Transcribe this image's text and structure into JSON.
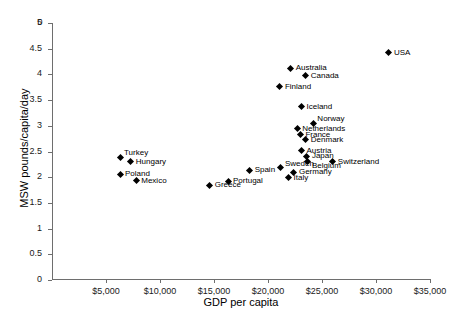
{
  "chart_data": {
    "type": "scatter",
    "title": "",
    "xlabel": "GDP per capita",
    "ylabel": "MSW  pounds/capita/day",
    "xlim": [
      0,
      35000
    ],
    "ylim": [
      0,
      5
    ],
    "grid": false,
    "legend": null,
    "xticks": [
      0,
      5000,
      10000,
      15000,
      20000,
      25000,
      30000,
      35000
    ],
    "xticklabels": [
      "0",
      "$5,000",
      "$10,000",
      "$15,000",
      "$20,000",
      "$25,000",
      "$30,000",
      "$35,000"
    ],
    "yticks": [
      0,
      0.5,
      1,
      1.5,
      2,
      2.5,
      3,
      3.5,
      4,
      4.5,
      5
    ],
    "yticklabels": [
      "0",
      "0.5",
      "1",
      "1.5",
      "2",
      "2.5",
      "3",
      "3.5",
      "4",
      "4.5",
      "5"
    ],
    "marker": "diamond",
    "marker_color": "#000000",
    "points": [
      {
        "label": "USA",
        "x": 31200,
        "y": 4.42,
        "label_pos": "right"
      },
      {
        "label": "Australia",
        "x": 22100,
        "y": 4.12,
        "label_pos": "right"
      },
      {
        "label": "Canada",
        "x": 23500,
        "y": 3.97,
        "label_pos": "right"
      },
      {
        "label": "Finland",
        "x": 21100,
        "y": 3.76,
        "label_pos": "right"
      },
      {
        "label": "Iceland",
        "x": 23100,
        "y": 3.37,
        "label_pos": "right"
      },
      {
        "label": "Norway",
        "x": 24200,
        "y": 3.05,
        "label_pos": "rightup"
      },
      {
        "label": "Netherlands",
        "x": 22700,
        "y": 2.94,
        "label_pos": "right"
      },
      {
        "label": "France",
        "x": 23000,
        "y": 2.83,
        "label_pos": "right"
      },
      {
        "label": "Denmark",
        "x": 23500,
        "y": 2.73,
        "label_pos": "right"
      },
      {
        "label": "Austria",
        "x": 23100,
        "y": 2.51,
        "label_pos": "right"
      },
      {
        "label": "Japan",
        "x": 23600,
        "y": 2.41,
        "label_pos": "right"
      },
      {
        "label": "Belgium",
        "x": 23700,
        "y": 2.31,
        "label_pos": "rightdown"
      },
      {
        "label": "Switzerland",
        "x": 26000,
        "y": 2.3,
        "label_pos": "right"
      },
      {
        "label": "Sweden",
        "x": 21200,
        "y": 2.18,
        "label_pos": "rightup"
      },
      {
        "label": "Germany",
        "x": 22400,
        "y": 2.1,
        "label_pos": "right"
      },
      {
        "label": "Italy",
        "x": 21900,
        "y": 1.99,
        "label_pos": "right"
      },
      {
        "label": "Spain",
        "x": 18300,
        "y": 2.14,
        "label_pos": "right"
      },
      {
        "label": "Portugal",
        "x": 16300,
        "y": 1.92,
        "label_pos": "right"
      },
      {
        "label": "Greece",
        "x": 14600,
        "y": 1.84,
        "label_pos": "right"
      },
      {
        "label": "Turkey",
        "x": 6300,
        "y": 2.39,
        "label_pos": "rightup"
      },
      {
        "label": "Hungary",
        "x": 7300,
        "y": 2.3,
        "label_pos": "right"
      },
      {
        "label": "Poland",
        "x": 6300,
        "y": 2.06,
        "label_pos": "right"
      },
      {
        "label": "Mexico",
        "x": 7800,
        "y": 1.93,
        "label_pos": "right"
      }
    ]
  }
}
